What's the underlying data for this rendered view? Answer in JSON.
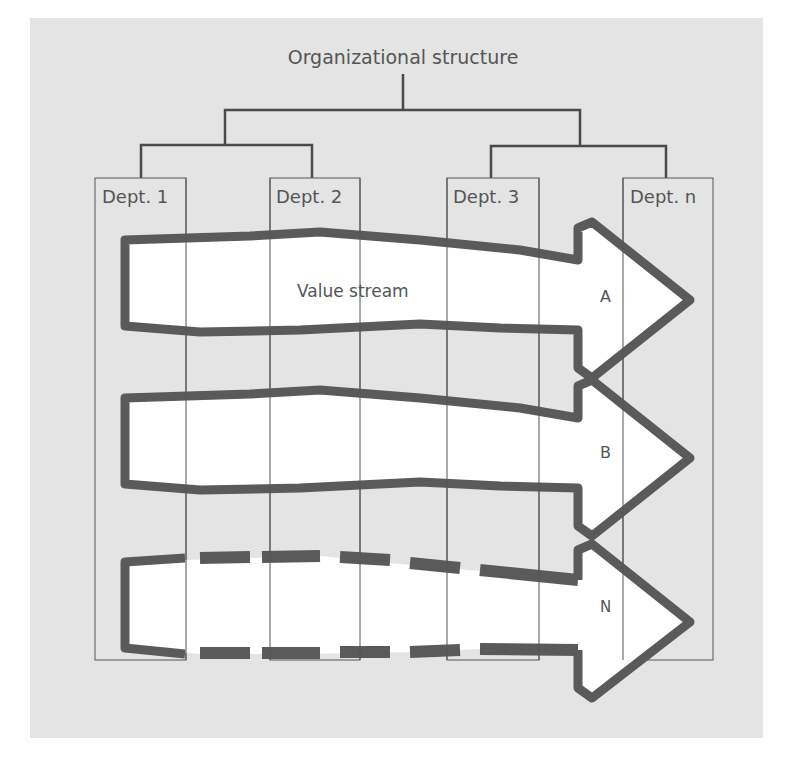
{
  "diagram": {
    "title": "Organizational structure",
    "departments": [
      {
        "label": "Dept. 1"
      },
      {
        "label": "Dept. 2"
      },
      {
        "label": "Dept. 3"
      },
      {
        "label": "Dept. n"
      }
    ],
    "streams": [
      {
        "label": "A",
        "style": "solid"
      },
      {
        "label": "B",
        "style": "solid"
      },
      {
        "label": "N",
        "style": "dashed"
      }
    ],
    "stream_caption": "Value stream",
    "colors": {
      "background": "#e4e4e4",
      "line": "#555555",
      "arrow_outline": "#5a5a5a",
      "arrow_fill": "#ffffff"
    }
  }
}
